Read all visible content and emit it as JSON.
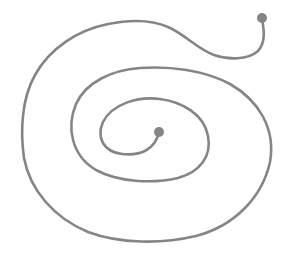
{
  "diagram": {
    "type": "spiral",
    "stroke_color": "#858585",
    "dot_color": "#858585",
    "background_color": "#ffffff",
    "stroke_width": 2.6,
    "endpoints": {
      "outer": {
        "cx": 262,
        "cy": 18,
        "r": 5
      },
      "inner": {
        "cx": 159,
        "cy": 132,
        "r": 5
      }
    },
    "path": "M262,18 C264,30 266,42 258,51 C248,60 228,60 214,55 C196,48 186,35 168,27 C150,19 128,20 108,24 C78,30 50,48 35,75 C22,98 20,130 24,158 C30,190 54,218 88,232 C120,244 162,244 196,236 C234,226 262,198 270,162 C276,128 258,100 230,84 C204,70 170,66 140,68 C112,70 86,82 76,104 C66,128 72,156 96,170 C118,182 152,184 178,178 C200,172 212,156 208,136 C204,114 182,102 160,99 C138,96 112,104 103,122 C96,138 104,152 122,154 C140,156 155,150 159,132"
  }
}
